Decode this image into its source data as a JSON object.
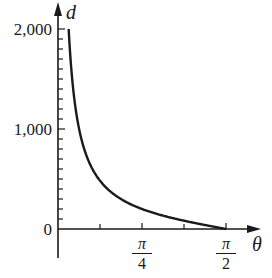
{
  "chart_data": {
    "type": "line",
    "title": "",
    "xlabel": "θ",
    "ylabel": "d",
    "function": "d ≈ 200·cot(θ)",
    "x_range": [
      0,
      1.5708
    ],
    "ylim": [
      0,
      2000
    ],
    "y_ticks": [
      "0",
      "1,000",
      "2,000"
    ],
    "y_minor_tick_step": 100,
    "x_ticks": [
      {
        "num": "π",
        "den": "4",
        "value": 0.7854
      },
      {
        "num": "π",
        "den": "2",
        "value": 1.5708
      }
    ],
    "x_minor_ticks": [
      0.3927,
      1.1781
    ],
    "series": [
      {
        "name": "d",
        "x": [
          0.0997,
          0.15,
          0.2,
          0.3,
          0.3927,
          0.5,
          0.6,
          0.7854,
          1.0,
          1.1781,
          1.3,
          1.5708
        ],
        "values": [
          2000,
          1322,
          987,
          647,
          483,
          366,
          292,
          200,
          128,
          83,
          56,
          0
        ]
      }
    ],
    "grid": false,
    "legend": null
  },
  "axes": {
    "y_label": "d",
    "x_label": "θ",
    "y_tick_labels": [
      "2,000",
      "1,000",
      "0"
    ],
    "x_tick_labels": [
      {
        "num": "π",
        "den": "4"
      },
      {
        "num": "π",
        "den": "2"
      }
    ]
  }
}
